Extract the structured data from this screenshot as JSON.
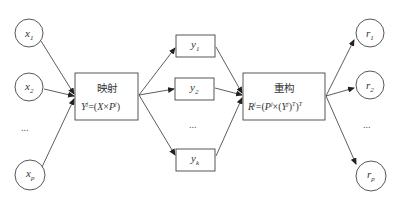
{
  "diagram": {
    "inputs": [
      {
        "base": "x",
        "sub": "1"
      },
      {
        "base": "x",
        "sub": "2"
      },
      {
        "base": "x",
        "sub": "p"
      }
    ],
    "inputs_ellipsis": "...",
    "mapping": {
      "title": "映射",
      "formula_lhs": "Y",
      "formula_lhs_sup": "j",
      "formula_eq": "=(",
      "formula_x": "X",
      "formula_times": "×",
      "formula_p": "P",
      "formula_p_sup": "j",
      "formula_close": ")"
    },
    "latents": [
      {
        "base": "y",
        "sub": "1"
      },
      {
        "base": "y",
        "sub": "2"
      },
      {
        "base": "y",
        "sub": "k"
      }
    ],
    "latents_ellipsis": "...",
    "reconstruct": {
      "title": "重构",
      "formula_lhs": "R",
      "formula_lhs_sup": "j",
      "formula_eq": "=(",
      "formula_p": "P",
      "formula_p_sup": "j",
      "formula_times": "×(",
      "formula_y": "Y",
      "formula_y_sup": "j",
      "formula_close1": ")",
      "formula_t1": "T",
      "formula_close2": ")",
      "formula_t2": "T"
    },
    "outputs": [
      {
        "base": "r",
        "sub": "1"
      },
      {
        "base": "r",
        "sub": "2"
      },
      {
        "base": "r",
        "sub": "p"
      }
    ],
    "outputs_ellipsis": "..."
  }
}
